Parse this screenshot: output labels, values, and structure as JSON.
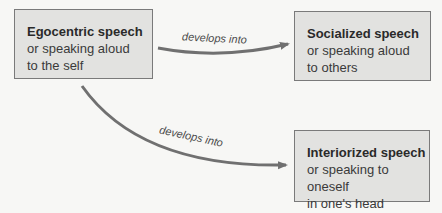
{
  "nodes": [
    {
      "id": "egocentric",
      "title": "Egocentric speech",
      "lines": [
        "or speaking aloud",
        "to the self"
      ]
    },
    {
      "id": "socialized",
      "title": "Socialized speech",
      "lines": [
        "or speaking aloud",
        "to others"
      ]
    },
    {
      "id": "interiorized",
      "title": "Interiorized speech",
      "lines": [
        "or speaking to oneself",
        "in one's head"
      ]
    }
  ],
  "edges": [
    {
      "from": "egocentric",
      "to": "socialized",
      "label": "develops into"
    },
    {
      "from": "egocentric",
      "to": "interiorized",
      "label": "develops into"
    }
  ],
  "colors": {
    "box_fill": "#e2e2e0",
    "box_border": "#7a7a7a",
    "arrow": "#707070",
    "background": "#f7f7f5"
  }
}
